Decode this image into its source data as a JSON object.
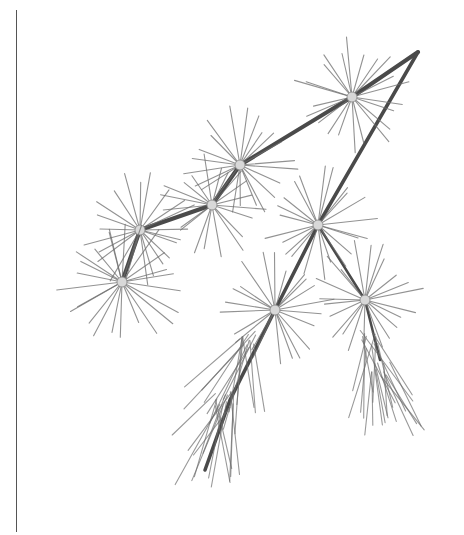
{
  "image": {
    "subject": "pencil illustration of a larch branch with needle clusters",
    "background_color": "#ffffff",
    "ink_color": "#6e6e6e",
    "frame_line_color": "#555555"
  },
  "branch": {
    "main_stem": [
      [
        418,
        52
      ],
      [
        352,
        97
      ],
      [
        240,
        165
      ],
      [
        212,
        205
      ],
      [
        140,
        230
      ],
      [
        122,
        282
      ]
    ],
    "twig_stem": [
      [
        418,
        52
      ],
      [
        318,
        225
      ],
      [
        275,
        310
      ],
      [
        230,
        400
      ],
      [
        205,
        470
      ]
    ],
    "side_twig": [
      [
        318,
        225
      ],
      [
        365,
        300
      ],
      [
        380,
        360
      ]
    ]
  },
  "needle_clusters": [
    {
      "cx": 352,
      "cy": 97,
      "r": 55,
      "count": 22
    },
    {
      "cx": 240,
      "cy": 165,
      "r": 55,
      "count": 22
    },
    {
      "cx": 212,
      "cy": 205,
      "r": 50,
      "count": 20
    },
    {
      "cx": 140,
      "cy": 230,
      "r": 55,
      "count": 22
    },
    {
      "cx": 122,
      "cy": 282,
      "r": 60,
      "count": 24
    },
    {
      "cx": 318,
      "cy": 225,
      "r": 55,
      "count": 22
    },
    {
      "cx": 275,
      "cy": 310,
      "r": 55,
      "count": 22
    },
    {
      "cx": 365,
      "cy": 300,
      "r": 55,
      "count": 22
    }
  ],
  "drooping_needles": [
    {
      "x": 250,
      "y": 340,
      "len": 90,
      "count": 14,
      "spread": 60,
      "dir": 110
    },
    {
      "x": 225,
      "y": 400,
      "len": 85,
      "count": 14,
      "spread": 60,
      "dir": 105
    },
    {
      "x": 370,
      "y": 340,
      "len": 80,
      "count": 12,
      "spread": 50,
      "dir": 80
    },
    {
      "x": 380,
      "y": 370,
      "len": 70,
      "count": 10,
      "spread": 45,
      "dir": 75
    }
  ]
}
